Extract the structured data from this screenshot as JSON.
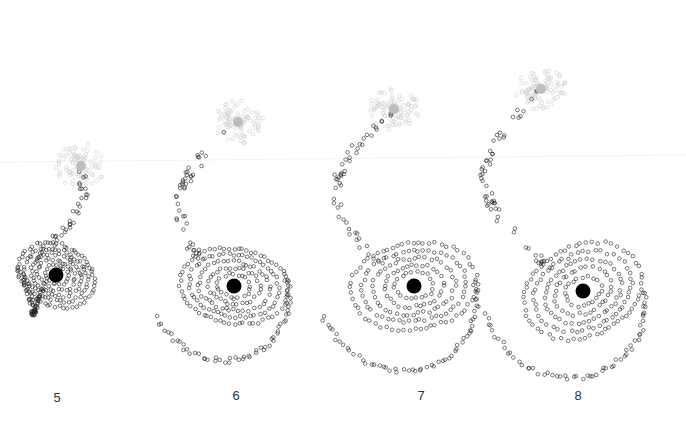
{
  "figure": {
    "panels": [
      {
        "label": "5",
        "label_pos": [
          57,
          398
        ],
        "main": [
          56,
          275
        ],
        "companion": [
          81,
          166
        ],
        "ring_r": 38,
        "tail": "left-down",
        "rot": 0.0
      },
      {
        "label": "6",
        "label_pos": [
          236,
          396
        ],
        "main": [
          234,
          286
        ],
        "companion": [
          238,
          122
        ],
        "ring_r": 50,
        "tail": "down-left",
        "rot": 0.6
      },
      {
        "label": "7",
        "label_pos": [
          421,
          396
        ],
        "main": [
          414,
          286
        ],
        "companion": [
          394,
          109
        ],
        "ring_r": 58,
        "tail": "down",
        "rot": 1.1
      },
      {
        "label": "8",
        "label_pos": [
          578,
          396
        ],
        "main": [
          583,
          291
        ],
        "companion": [
          541,
          89
        ],
        "ring_r": 58,
        "tail": "down",
        "rot": 1.5
      }
    ],
    "colors": {
      "main_nucleus": "#000000",
      "companion_nucleus": "#bdbdbd",
      "particle_stroke": "#222222",
      "companion_particle_stroke": "#d0d0d0",
      "background": "#ffffff"
    }
  }
}
